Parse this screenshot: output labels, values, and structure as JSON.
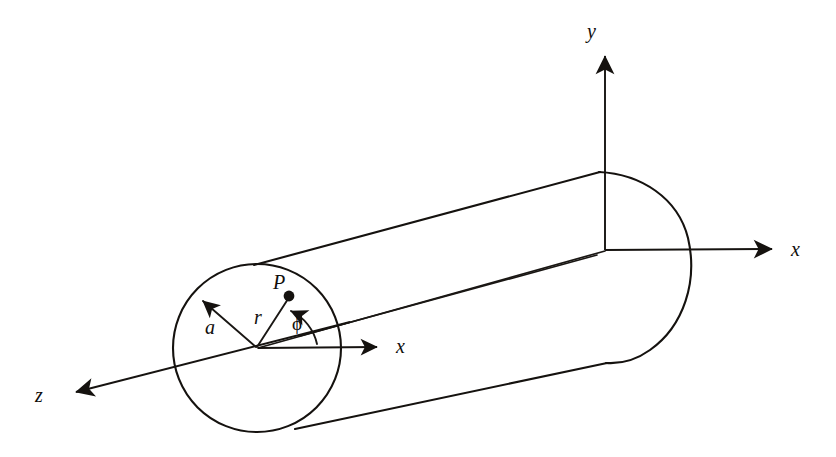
{
  "figure": {
    "background_color": "#ffffff",
    "ink_color": "#15120f",
    "width": 836,
    "height": 457
  },
  "labels": {
    "axis_y": "y",
    "axis_x_global": "x",
    "axis_x_local": "x",
    "axis_z": "z",
    "point_p": "P",
    "radius_a": "a",
    "radial_r": "r",
    "angle_phi": "ϕ"
  },
  "annotations": {
    "point_p_name": "point-P-marker",
    "cylinder_name": "circular-cylinder",
    "left_cap_name": "left-end-circle",
    "right_cap_name": "right-end-arc"
  },
  "geometry": {
    "left_circle": {
      "cx": 257,
      "cy": 348,
      "r": 84
    },
    "origin_global": {
      "x": 605,
      "y": 250
    },
    "point_p": {
      "x": 289,
      "y": 296
    },
    "y_axis_tip": {
      "x": 605,
      "y": 48
    },
    "x_axis_tip": {
      "x": 780,
      "y": 248
    },
    "z_axis_tip": {
      "x": 68,
      "y": 393
    },
    "local_x_tip": {
      "x": 385,
      "y": 347
    }
  }
}
